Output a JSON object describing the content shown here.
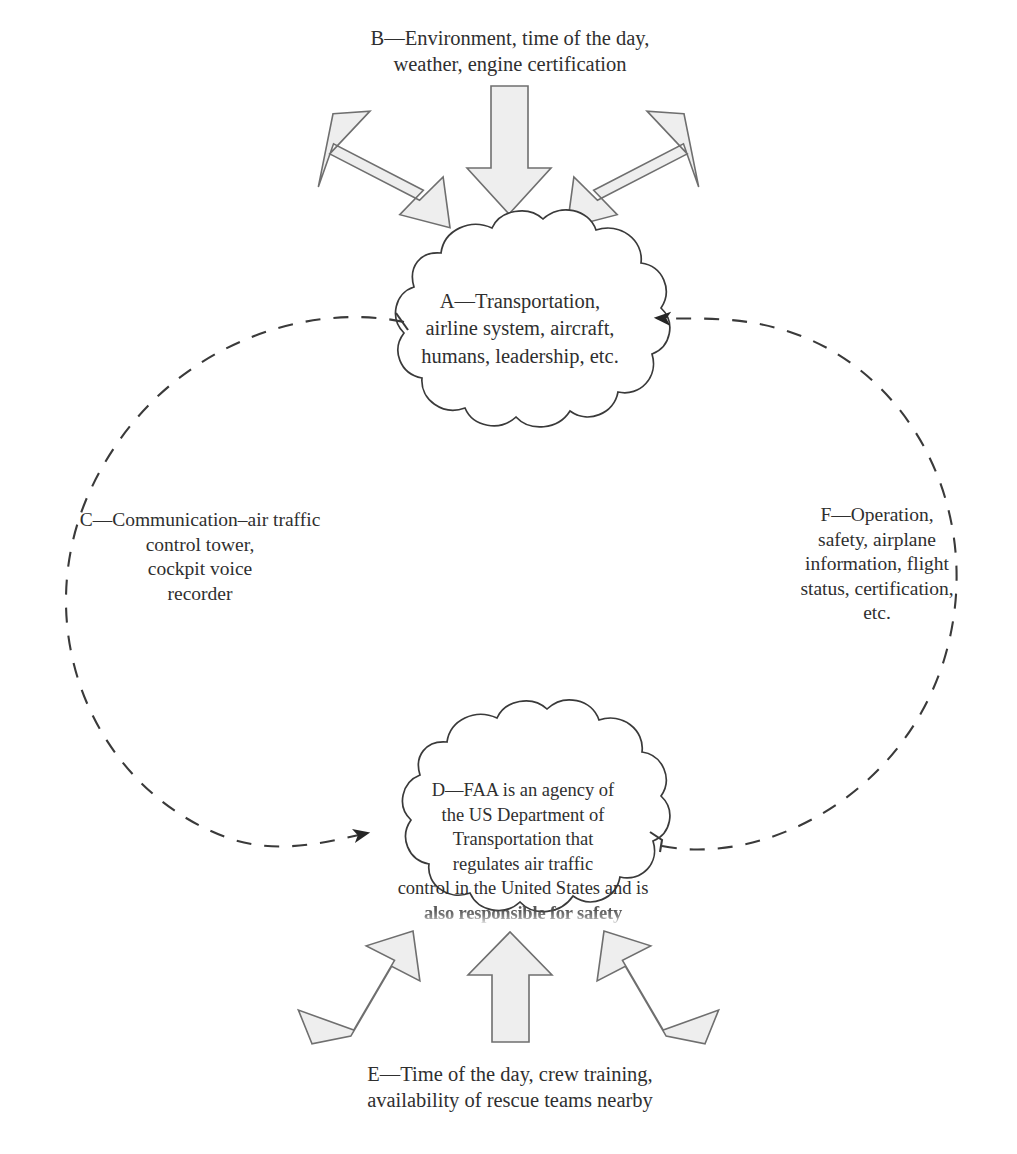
{
  "diagram": {
    "colors": {
      "text": "#2f2f2f",
      "cloud_outline": "#3a3a3a",
      "cloud_fill": "#ffffff",
      "block_arrow_fill": "#eeeeee",
      "block_arrow_outline": "#7a7a7a",
      "dashed_curve": "#3a3a3a",
      "arrowhead": "#2b2b2b",
      "background": "#ffffff"
    }
  },
  "clouds": {
    "a": {
      "id": "A",
      "text": "A—Transportation,\nairline system, aircraft,\nhumans, leadership, etc.",
      "lines": [
        "A—Transportation,",
        "airline system, aircraft,",
        "humans, leadership, etc."
      ]
    },
    "d": {
      "id": "D",
      "lines": [
        "D—FAA is an agency of",
        "the US Department of",
        "Transportation that",
        "regulates air traffic",
        "control in the United States and is"
      ],
      "text": "D—FAA is an agency of\nthe US Department of\nTransportation that\nregulates air traffic\ncontrol in the United States and is",
      "clipped_line": "also responsible for safety"
    }
  },
  "labels": {
    "b": {
      "id": "B",
      "text": "B—Environment, time of the day,\nweather, engine certification",
      "lines": [
        "B—Environment, time of the day,",
        "weather, engine certification"
      ]
    },
    "c": {
      "id": "C",
      "text": "C—Communication–air traffic\ncontrol tower,\ncockpit voice\nrecorder",
      "lines": [
        "C—Communication–air traffic",
        "control tower,",
        "cockpit voice",
        "recorder"
      ]
    },
    "e": {
      "id": "E",
      "text": "E—Time of the day, crew training,\navailability of rescue teams nearby",
      "lines": [
        "E—Time of the day, crew training,",
        "availability of rescue teams nearby"
      ]
    },
    "f": {
      "id": "F",
      "text": "F—Operation,\nsafety, airplane\ninformation, flight\nstatus, certification,\netc.",
      "lines": [
        "F—Operation,",
        "safety, airplane",
        "information, flight",
        "status, certification,",
        "etc."
      ]
    }
  },
  "arrows": {
    "top": [
      {
        "name": "top-left-block-arrow",
        "direction": "down-right",
        "target": "A"
      },
      {
        "name": "top-center-block-arrow",
        "direction": "down",
        "target": "A"
      },
      {
        "name": "top-right-block-arrow",
        "direction": "down-left",
        "target": "A"
      }
    ],
    "bottom": [
      {
        "name": "bottom-left-block-arrow",
        "direction": "up-right",
        "target": "D"
      },
      {
        "name": "bottom-center-block-arrow",
        "direction": "up",
        "target": "D"
      },
      {
        "name": "bottom-right-block-arrow",
        "direction": "up-left",
        "target": "D"
      }
    ],
    "curves": [
      {
        "name": "left-dashed-curve",
        "from": "A",
        "to": "D",
        "style": "dashed",
        "arrowhead": "at-D"
      },
      {
        "name": "right-dashed-curve",
        "from": "D",
        "to": "A",
        "style": "dashed",
        "arrowhead": "at-A"
      }
    ]
  }
}
